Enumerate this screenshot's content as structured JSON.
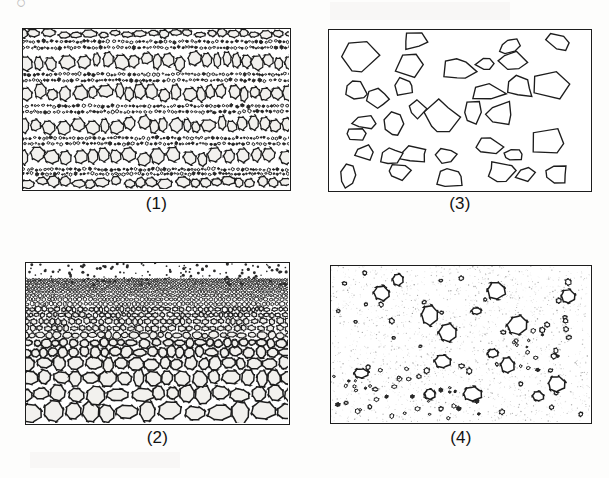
{
  "figure": {
    "background_color": "#fdfdfc",
    "outline_color": "#1d1d1d",
    "clast_fill": "#f2f1ee",
    "dark_fill": "#2a2a2a",
    "stipple_color": "#8d8d8d",
    "corner_glyph": "○"
  },
  "panels": [
    {
      "id": "panel-1",
      "label": "(1)",
      "texture": "poorly-sorted-stratified-conglomerate",
      "description": "Dense poorly sorted clasts in crude horizontal bands; coarse light clasts alternating with dark fine-grained bands",
      "x": 22,
      "y": 28,
      "width": 269,
      "height": 163,
      "label_y": 194,
      "bands": [
        {
          "type": "coarse",
          "top": 0.0,
          "height": 0.06
        },
        {
          "type": "fine",
          "top": 0.06,
          "height": 0.075
        },
        {
          "type": "coarse",
          "top": 0.135,
          "height": 0.13
        },
        {
          "type": "fine",
          "top": 0.265,
          "height": 0.075
        },
        {
          "type": "coarse",
          "top": 0.34,
          "height": 0.125
        },
        {
          "type": "fine",
          "top": 0.465,
          "height": 0.07
        },
        {
          "type": "coarse",
          "top": 0.535,
          "height": 0.13
        },
        {
          "type": "fine",
          "top": 0.665,
          "height": 0.07
        },
        {
          "type": "coarse",
          "top": 0.735,
          "height": 0.13
        },
        {
          "type": "fine",
          "top": 0.865,
          "height": 0.055
        },
        {
          "type": "coarse",
          "top": 0.92,
          "height": 0.08
        }
      ],
      "coarse_clast_size": [
        9,
        17
      ],
      "fine_clast_size": [
        2.0,
        4.2
      ],
      "seed": 1207
    },
    {
      "id": "panel-2",
      "label": "(2)",
      "texture": "normally-graded-bedding",
      "description": "Graded bed: large rounded clasts at base fining upward to granules and sand specks at top",
      "x": 25,
      "y": 262,
      "width": 265,
      "height": 163,
      "label_y": 428,
      "grading": {
        "bottom_clast_size": 23,
        "top_clast_size": 2.2,
        "speck_zone_top": 0.0,
        "speck_zone_bottom": 0.11
      },
      "seed": 4421
    },
    {
      "id": "panel-3",
      "label": "(3)",
      "texture": "angular-clasts-open-framework",
      "description": "Well separated angular polygonal clasts on white background, breccia texture",
      "x": 328,
      "y": 29,
      "width": 264,
      "height": 163,
      "label_y": 194,
      "clast_count": 34,
      "clast_size": [
        22,
        44
      ],
      "vertices": [
        5,
        7
      ],
      "seed": 7788
    },
    {
      "id": "panel-4",
      "label": "(4)",
      "texture": "matrix-supported-diamictite",
      "description": "Isolated outsized clasts floating in fine stippled matrix, with local clusters of small pebbles",
      "x": 330,
      "y": 265,
      "width": 262,
      "height": 159,
      "label_y": 428,
      "stipple_density": 1900,
      "large_clasts": 16,
      "large_clast_size": [
        11,
        23
      ],
      "small_clasts": 42,
      "small_clast_size": [
        3.5,
        7
      ],
      "clusters": [
        {
          "cx": 0.18,
          "cy": 0.82,
          "r": 0.2,
          "count": 26
        },
        {
          "cx": 0.76,
          "cy": 0.52,
          "r": 0.14,
          "count": 20
        },
        {
          "cx": 0.46,
          "cy": 0.93,
          "r": 0.13,
          "count": 14
        }
      ],
      "seed": 3159
    }
  ]
}
